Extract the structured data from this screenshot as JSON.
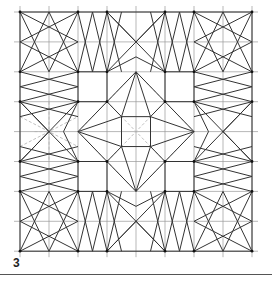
{
  "figure": {
    "label": "3",
    "grid": {
      "origin_x": 20,
      "origin_y": 12,
      "cell_w": 29,
      "cell_h": 29.9,
      "cells": 8,
      "extend": 6,
      "color": "#9a9a9a"
    },
    "colors": {
      "line": "#333333",
      "dashed": "#b0b0b0",
      "vertex": "#111111"
    },
    "vertices_axis": [
      0,
      2,
      3,
      5,
      6,
      8
    ],
    "solid_segments": [
      [
        0,
        0,
        8,
        0
      ],
      [
        0,
        8,
        8,
        8
      ],
      [
        0,
        0,
        0,
        8
      ],
      [
        8,
        0,
        8,
        8
      ],
      [
        2,
        2,
        3,
        2
      ],
      [
        2,
        3,
        3,
        3
      ],
      [
        2,
        2,
        2,
        3
      ],
      [
        3,
        2,
        3,
        3
      ],
      [
        5,
        2,
        6,
        2
      ],
      [
        5,
        3,
        6,
        3
      ],
      [
        5,
        2,
        5,
        3
      ],
      [
        6,
        2,
        6,
        3
      ],
      [
        2,
        5,
        3,
        5
      ],
      [
        2,
        6,
        3,
        6
      ],
      [
        2,
        5,
        2,
        6
      ],
      [
        3,
        5,
        3,
        6
      ],
      [
        5,
        5,
        6,
        5
      ],
      [
        5,
        6,
        6,
        6
      ],
      [
        5,
        5,
        5,
        6
      ],
      [
        6,
        5,
        6,
        6
      ],
      [
        0,
        0,
        2,
        1
      ],
      [
        0,
        0,
        1,
        2
      ],
      [
        2,
        0,
        0,
        1
      ],
      [
        2,
        0,
        1,
        2
      ],
      [
        0,
        2,
        1,
        0
      ],
      [
        0,
        2,
        2,
        1
      ],
      [
        2,
        2,
        1,
        0
      ],
      [
        2,
        2,
        0,
        1
      ],
      [
        6,
        0,
        8,
        1
      ],
      [
        6,
        0,
        7,
        2
      ],
      [
        8,
        0,
        6,
        1
      ],
      [
        8,
        0,
        7,
        2
      ],
      [
        6,
        2,
        7,
        0
      ],
      [
        6,
        2,
        8,
        1
      ],
      [
        8,
        2,
        7,
        0
      ],
      [
        8,
        2,
        6,
        1
      ],
      [
        0,
        6,
        2,
        7
      ],
      [
        0,
        6,
        1,
        8
      ],
      [
        2,
        6,
        0,
        7
      ],
      [
        2,
        6,
        1,
        8
      ],
      [
        0,
        8,
        1,
        6
      ],
      [
        0,
        8,
        2,
        7
      ],
      [
        2,
        8,
        1,
        6
      ],
      [
        2,
        8,
        0,
        7
      ],
      [
        6,
        6,
        8,
        7
      ],
      [
        6,
        6,
        7,
        8
      ],
      [
        8,
        6,
        6,
        7
      ],
      [
        8,
        6,
        7,
        8
      ],
      [
        6,
        8,
        7,
        6
      ],
      [
        6,
        8,
        8,
        7
      ],
      [
        8,
        8,
        7,
        6
      ],
      [
        8,
        8,
        6,
        7
      ],
      [
        2,
        0,
        2.5,
        2
      ],
      [
        3,
        0,
        2.5,
        2
      ],
      [
        2,
        2,
        2.5,
        0
      ],
      [
        3,
        2,
        2.5,
        0
      ],
      [
        5,
        0,
        5.5,
        2
      ],
      [
        6,
        0,
        5.5,
        2
      ],
      [
        5,
        2,
        5.5,
        0
      ],
      [
        6,
        2,
        5.5,
        0
      ],
      [
        2,
        6,
        2.5,
        8
      ],
      [
        3,
        6,
        2.5,
        8
      ],
      [
        2,
        8,
        2.5,
        6
      ],
      [
        3,
        8,
        2.5,
        6
      ],
      [
        5,
        6,
        5.5,
        8
      ],
      [
        6,
        6,
        5.5,
        8
      ],
      [
        5,
        8,
        5.5,
        6
      ],
      [
        6,
        8,
        5.5,
        6
      ],
      [
        0,
        2,
        2,
        2.5
      ],
      [
        0,
        3,
        2,
        2.5
      ],
      [
        2,
        2,
        0,
        2.5
      ],
      [
        2,
        3,
        0,
        2.5
      ],
      [
        0,
        5,
        2,
        5.5
      ],
      [
        0,
        6,
        2,
        5.5
      ],
      [
        2,
        5,
        0,
        5.5
      ],
      [
        2,
        6,
        0,
        5.5
      ],
      [
        6,
        2,
        8,
        2.5
      ],
      [
        6,
        3,
        8,
        2.5
      ],
      [
        8,
        2,
        6,
        2.5
      ],
      [
        8,
        3,
        6,
        2.5
      ],
      [
        6,
        5,
        8,
        5.5
      ],
      [
        6,
        6,
        8,
        5.5
      ],
      [
        8,
        5,
        6,
        5.5
      ],
      [
        8,
        6,
        6,
        5.5
      ],
      [
        3,
        0,
        4,
        1
      ],
      [
        5,
        0,
        4,
        1
      ],
      [
        3,
        0,
        3.5,
        2
      ],
      [
        5,
        0,
        4.5,
        2
      ],
      [
        3,
        2,
        4,
        1.5
      ],
      [
        5,
        2,
        4,
        1.5
      ],
      [
        3,
        2,
        3.5,
        0
      ],
      [
        5,
        2,
        4.5,
        0
      ],
      [
        3,
        2,
        5,
        0
      ],
      [
        5,
        2,
        3,
        0
      ],
      [
        3,
        8,
        4,
        7
      ],
      [
        5,
        8,
        4,
        7
      ],
      [
        3,
        8,
        3.5,
        6
      ],
      [
        5,
        8,
        4.5,
        6
      ],
      [
        3,
        6,
        4,
        6.5
      ],
      [
        5,
        6,
        4,
        6.5
      ],
      [
        3,
        6,
        3.5,
        8
      ],
      [
        5,
        6,
        4.5,
        8
      ],
      [
        3,
        6,
        5,
        8
      ],
      [
        5,
        6,
        3,
        8
      ],
      [
        0,
        3,
        1,
        4
      ],
      [
        0,
        5,
        1,
        4
      ],
      [
        0,
        3,
        2,
        3.5
      ],
      [
        0,
        5,
        2,
        4.5
      ],
      [
        2,
        3,
        1.5,
        4
      ],
      [
        2,
        5,
        1.5,
        4
      ],
      [
        2,
        3,
        0,
        3.5
      ],
      [
        2,
        5,
        0,
        4.5
      ],
      [
        2,
        3,
        0,
        5
      ],
      [
        2,
        5,
        0,
        3
      ],
      [
        8,
        3,
        7,
        4
      ],
      [
        8,
        5,
        7,
        4
      ],
      [
        8,
        3,
        6,
        3.5
      ],
      [
        8,
        5,
        6,
        4.5
      ],
      [
        6,
        3,
        6.5,
        4
      ],
      [
        6,
        5,
        6.5,
        4
      ],
      [
        6,
        3,
        8,
        3.5
      ],
      [
        6,
        5,
        8,
        4.5
      ],
      [
        6,
        3,
        8,
        5
      ],
      [
        6,
        5,
        8,
        3
      ],
      [
        3,
        3,
        4,
        2
      ],
      [
        5,
        3,
        4,
        2
      ],
      [
        3,
        5,
        4,
        6
      ],
      [
        5,
        5,
        4,
        6
      ],
      [
        3,
        3,
        2,
        4
      ],
      [
        3,
        5,
        2,
        4
      ],
      [
        5,
        3,
        6,
        4
      ],
      [
        5,
        5,
        6,
        4
      ],
      [
        4,
        2,
        3.5,
        3.5
      ],
      [
        4,
        2,
        4.5,
        3.5
      ],
      [
        4,
        6,
        3.5,
        4.5
      ],
      [
        4,
        6,
        4.5,
        4.5
      ],
      [
        2,
        4,
        3.5,
        3.5
      ],
      [
        2,
        4,
        3.5,
        4.5
      ],
      [
        6,
        4,
        4.5,
        3.5
      ],
      [
        6,
        4,
        4.5,
        4.5
      ],
      [
        3.5,
        3.5,
        4.5,
        3.5
      ],
      [
        3.5,
        4.5,
        4.5,
        4.5
      ],
      [
        3.5,
        3.5,
        3.5,
        4.5
      ],
      [
        4.5,
        3.5,
        4.5,
        4.5
      ],
      [
        3,
        3,
        3.5,
        3.5
      ],
      [
        5,
        3,
        4.5,
        3.5
      ],
      [
        3,
        5,
        3.5,
        4.5
      ],
      [
        5,
        5,
        4.5,
        4.5
      ]
    ],
    "dashed_segments": [
      [
        4,
        2,
        2,
        4
      ],
      [
        2,
        4,
        4,
        6
      ],
      [
        4,
        6,
        6,
        4
      ],
      [
        6,
        4,
        4,
        2
      ],
      [
        3,
        3,
        5,
        5
      ],
      [
        5,
        3,
        3,
        5
      ],
      [
        1,
        3,
        1,
        5
      ],
      [
        0.5,
        4,
        1.5,
        4
      ],
      [
        0,
        3.5,
        2,
        4.5
      ],
      [
        0,
        4.5,
        2,
        3.5
      ]
    ]
  }
}
